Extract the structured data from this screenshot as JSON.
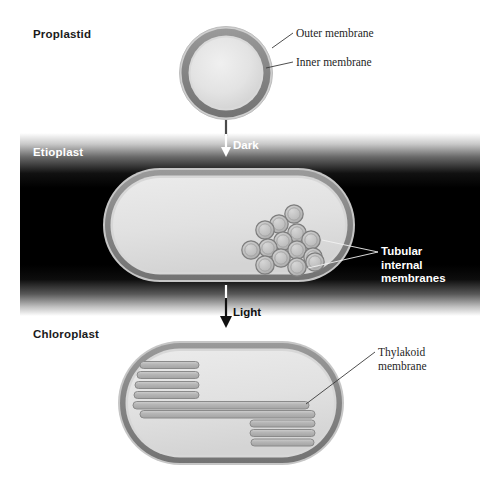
{
  "figure": {
    "background_color": "#ffffff",
    "dark_band_color": "#000000"
  },
  "stages": [
    {
      "id": "proplastid",
      "label": "Proplastid",
      "label_color": "#1a1a1a",
      "shape": "circle",
      "environment": "light"
    },
    {
      "id": "etioplast",
      "label": "Etioplast",
      "label_color": "#ffffff",
      "shape": "capsule",
      "environment": "dark"
    },
    {
      "id": "chloroplast",
      "label": "Chloroplast",
      "label_color": "#1a1a1a",
      "shape": "capsule",
      "environment": "light"
    }
  ],
  "transitions": [
    {
      "id": "dark",
      "label": "Dark",
      "from": "proplastid",
      "to": "etioplast",
      "arrow_color": "#ffffff",
      "label_color": "#ffffff"
    },
    {
      "id": "light",
      "label": "Light",
      "from": "etioplast",
      "to": "chloroplast",
      "arrow_color": "#111111",
      "label_color": "#111111"
    }
  ],
  "callouts": [
    {
      "id": "outer-membrane",
      "label": "Outer membrane",
      "target_stage": "proplastid",
      "color": "#1f1f1f",
      "style": "serif"
    },
    {
      "id": "inner-membrane",
      "label": "Inner membrane",
      "target_stage": "proplastid",
      "color": "#1f1f1f",
      "style": "serif"
    },
    {
      "id": "tubular-internal-membranes",
      "label": "Tubular\ninternal\nmembranes",
      "label_lines": [
        "Tubular",
        "internal",
        "membranes"
      ],
      "target_stage": "etioplast",
      "color": "#ffffff",
      "style": "sans-bold"
    },
    {
      "id": "thylakoid-membrane",
      "label": "Thylakoid\nmembrane",
      "label_lines": [
        "Thylakoid",
        "membrane"
      ],
      "target_stage": "chloroplast",
      "color": "#1f1f1f",
      "style": "serif"
    }
  ],
  "colors": {
    "membrane_band": "#8d8d8d",
    "membrane_line_light": "#d8d8d8",
    "stroma_fill": "#e2e2e2",
    "thylakoid_fill": "#b4b4b4",
    "thylakoid_stroke": "#8a8a8a",
    "vesicle_fill": "#bdbdbd",
    "vesicle_stroke": "#7d7d7d",
    "leader_line": "#3a3a3a"
  },
  "counts": {
    "tubular_vesicles": 14,
    "thylakoid_stack_upper": 5,
    "thylakoid_stack_lower": 4,
    "thylakoid_long_lamellae": 2
  }
}
